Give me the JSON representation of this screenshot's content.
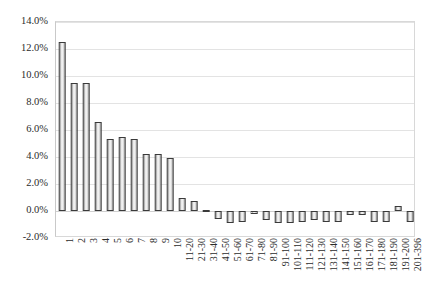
{
  "chart_data": {
    "type": "bar",
    "title": "",
    "subtitle": "",
    "xlabel": "",
    "ylabel": "",
    "ylim": [
      -0.02,
      0.14
    ],
    "ytick_labels": [
      "14.0%",
      "12.0%",
      "10.0%",
      "8.0%",
      "6.0%",
      "4.0%",
      "2.0%",
      "0.0%",
      "-2.0%"
    ],
    "ytick_values": [
      0.14,
      0.12,
      0.1,
      0.08,
      0.06,
      0.04,
      0.02,
      0.0,
      -0.02
    ],
    "grid": true,
    "legend": "none",
    "value_format": "percent",
    "categories": [
      "1",
      "2",
      "3",
      "4",
      "5",
      "6",
      "7",
      "8",
      "9",
      "10",
      "11-20",
      "21-30",
      "31-40",
      "41-50",
      "51-60",
      "61-70",
      "71-80",
      "81-90",
      "91-100",
      "101-110",
      "111-120",
      "121-130",
      "131-140",
      "141-150",
      "151-160",
      "161-170",
      "171-180",
      "181-190",
      "191-200",
      "201-396"
    ],
    "values": [
      0.125,
      0.095,
      0.095,
      0.066,
      0.053,
      0.055,
      0.053,
      0.042,
      0.042,
      0.039,
      0.01,
      0.0075,
      0.001,
      -0.006,
      -0.009,
      -0.008,
      -0.0015,
      -0.007,
      -0.009,
      -0.009,
      -0.008,
      -0.007,
      -0.008,
      -0.008,
      -0.003,
      -0.003,
      -0.008,
      -0.008,
      0.004,
      -0.008
    ]
  }
}
